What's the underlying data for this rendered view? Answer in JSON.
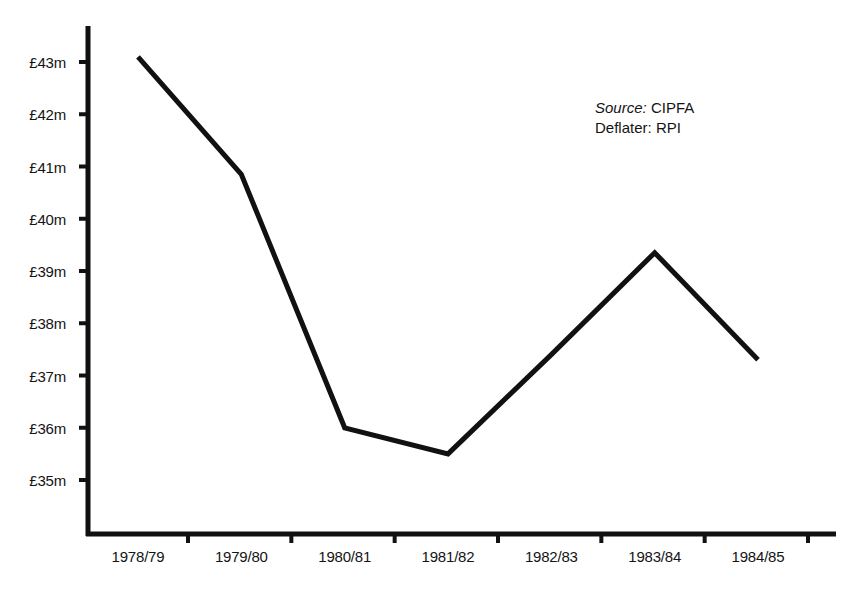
{
  "chart_data": {
    "type": "line",
    "title": "",
    "subtitle": "",
    "xlabel": "",
    "ylabel": "",
    "categories": [
      "1978/79",
      "1979/80",
      "1980/81",
      "1981/82",
      "1982/83",
      "1983/84",
      "1984/85"
    ],
    "values": [
      43.1,
      40.85,
      36.0,
      35.5,
      37.4,
      39.35,
      37.3
    ],
    "series": [
      {
        "name": "Expenditure",
        "values": [
          43.1,
          40.85,
          36.0,
          35.5,
          37.4,
          39.35,
          37.3
        ]
      }
    ],
    "ytick_labels": [
      "£43m",
      "£42m",
      "£41m",
      "£40m",
      "£39m",
      "£38m",
      "£37m",
      "£36m",
      "£35m"
    ],
    "ytick_values": [
      43,
      42,
      41,
      40,
      39,
      38,
      37,
      36,
      35
    ],
    "ylim": [
      33.9,
      43.6
    ],
    "xlim": [
      -0.6,
      6.9
    ],
    "grid": false,
    "legend": "none",
    "line_color": "#111111",
    "axis_color": "#111111",
    "background_color": "#ffffff",
    "units": "£ million",
    "annotations": [
      {
        "key": "Source:",
        "value": "CIPFA",
        "key_style": "italic"
      },
      {
        "key": "Deflater:",
        "value": "RPI",
        "key_style": "normal"
      }
    ]
  }
}
